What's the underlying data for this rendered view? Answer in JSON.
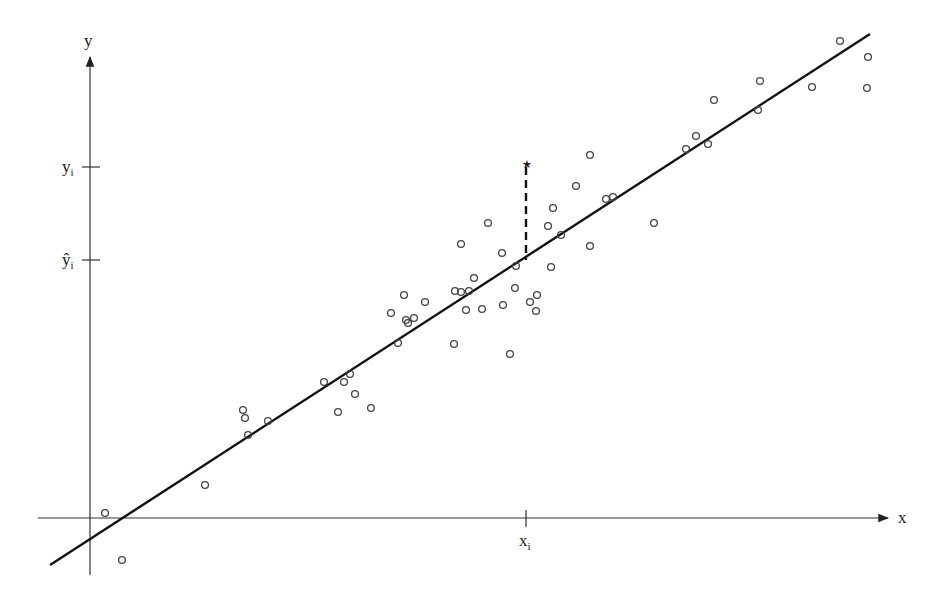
{
  "diagram": {
    "type": "linear-regression-residual",
    "labels": {
      "y_axis": "y",
      "x_axis": "x",
      "y_i": "y",
      "y_i_sub": "i",
      "y_hat_i": "ŷ",
      "y_hat_i_sub": "i",
      "x_i": "x",
      "x_i_sub": "i"
    },
    "colors": {
      "ink": "#111111",
      "point": "#444444",
      "background": "#ffffff"
    },
    "axes": {
      "origin_px": [
        90,
        518
      ],
      "x_axis": {
        "from": [
          38,
          518
        ],
        "to": [
          890,
          518
        ]
      },
      "y_axis": {
        "from": [
          90,
          575
        ],
        "to": [
          90,
          55
        ]
      }
    },
    "regression_line": {
      "from": [
        50,
        565
      ],
      "to": [
        870,
        34
      ]
    },
    "residual": {
      "x": 526,
      "y_observed": 162,
      "y_fitted": 260
    },
    "ticks": {
      "y_i": 167,
      "y_hat_i": 260,
      "x_i": 526
    },
    "points": [
      [
        105,
        513
      ],
      [
        122,
        560
      ],
      [
        205,
        485
      ],
      [
        243,
        410
      ],
      [
        245,
        418
      ],
      [
        248,
        435
      ],
      [
        268,
        421
      ],
      [
        324,
        382
      ],
      [
        338,
        412
      ],
      [
        344,
        382
      ],
      [
        350,
        374
      ],
      [
        355,
        394
      ],
      [
        371,
        408
      ],
      [
        391,
        313
      ],
      [
        398,
        343
      ],
      [
        404,
        295
      ],
      [
        406,
        320
      ],
      [
        408,
        323
      ],
      [
        414,
        318
      ],
      [
        425,
        302
      ],
      [
        454,
        344
      ],
      [
        455,
        291
      ],
      [
        461,
        292
      ],
      [
        461,
        244
      ],
      [
        466,
        310
      ],
      [
        469,
        291
      ],
      [
        474,
        278
      ],
      [
        482,
        309
      ],
      [
        488,
        223
      ],
      [
        502,
        253
      ],
      [
        503,
        305
      ],
      [
        510,
        354
      ],
      [
        515,
        288
      ],
      [
        516,
        266
      ],
      [
        530,
        302
      ],
      [
        536,
        311
      ],
      [
        537,
        295
      ],
      [
        548,
        226
      ],
      [
        551,
        267
      ],
      [
        553,
        208
      ],
      [
        561,
        235
      ],
      [
        576,
        186
      ],
      [
        590,
        155
      ],
      [
        590,
        246
      ],
      [
        606,
        199
      ],
      [
        613,
        197
      ],
      [
        654,
        223
      ],
      [
        686,
        149
      ],
      [
        696,
        136
      ],
      [
        708,
        144
      ],
      [
        714,
        100
      ],
      [
        758,
        110
      ],
      [
        760,
        81
      ],
      [
        812,
        87
      ],
      [
        840,
        41
      ],
      [
        868,
        57
      ],
      [
        867,
        88
      ]
    ]
  }
}
